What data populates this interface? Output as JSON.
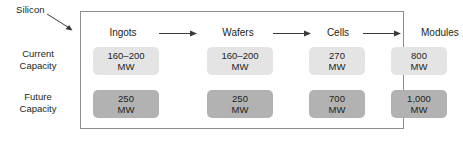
{
  "annotation": {
    "label": "Silicon",
    "icon": "arrow-diagonal-icon"
  },
  "stages": [
    {
      "label": "Ingots"
    },
    {
      "label": "Wafers"
    },
    {
      "label": "Cells"
    },
    {
      "label": "Modules"
    }
  ],
  "flow_arrow_icon": "arrow-right-icon",
  "rows": [
    {
      "label_line1": "Current",
      "label_line2": "Capacity",
      "style": "light",
      "cells": [
        {
          "value": "160–200",
          "unit": "MW"
        },
        {
          "value": "160–200",
          "unit": "MW"
        },
        {
          "value": "270",
          "unit": "MW"
        },
        {
          "value": "800",
          "unit": "MW"
        }
      ]
    },
    {
      "label_line1": "Future",
      "label_line2": "Capacity",
      "style": "dark",
      "cells": [
        {
          "value": "250",
          "unit": "MW"
        },
        {
          "value": "250",
          "unit": "MW"
        },
        {
          "value": "700",
          "unit": "MW"
        },
        {
          "value": "1,000",
          "unit": "MW"
        }
      ]
    }
  ],
  "colors": {
    "frame_border": "#8d8d8d",
    "box_light": "#e4e4e4",
    "box_dark": "#b2b2b2",
    "text": "#231f20",
    "arrow": "#3a3a3a"
  }
}
